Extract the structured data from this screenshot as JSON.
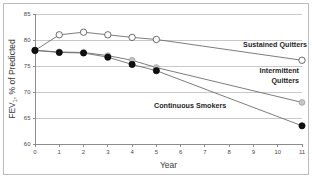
{
  "figure": {
    "background_color": "#ffffff",
    "border_color": "#bdbdbd",
    "width": 312,
    "height": 181
  },
  "chart_data": {
    "type": "line",
    "title": "",
    "xlabel": "Year",
    "ylabel": "FEV1, % of Predicted",
    "ylabel_main": "FEV",
    "ylabel_subscript": "1",
    "ylabel_rest": ", % of Predicted",
    "xlim": [
      0,
      11
    ],
    "ylim": [
      60,
      85
    ],
    "grid": true,
    "grid_axis": "y",
    "legend_position": "inline-annotations",
    "xticks": [
      0,
      1,
      2,
      3,
      4,
      5,
      6,
      7,
      8,
      9,
      10,
      11
    ],
    "xtick_labels": [
      "0",
      "1",
      "2",
      "3",
      "4",
      "5",
      "6",
      "7",
      "8",
      "9",
      "10",
      "11"
    ],
    "yticks": [
      60,
      65,
      70,
      75,
      80,
      85
    ],
    "ytick_labels": [
      "60",
      "65",
      "70",
      "75",
      "80",
      "85"
    ],
    "series": [
      {
        "name": "Sustained Quitters",
        "marker": "open-circle",
        "marker_fill": "#ffffff",
        "marker_stroke": "#5a5a5a",
        "line_color": "#6e6e6e",
        "x": [
          0,
          1,
          2,
          3,
          4,
          5,
          11
        ],
        "values": [
          78.0,
          81.0,
          81.5,
          81.0,
          80.5,
          80.1,
          76.1
        ]
      },
      {
        "name": "Intermittent Quitters",
        "marker": "gray-circle",
        "marker_fill": "#c4c4c4",
        "marker_stroke": "#9a9a9a",
        "line_color": "#6e6e6e",
        "x": [
          0,
          1,
          2,
          3,
          4,
          5,
          11
        ],
        "values": [
          78.0,
          77.7,
          77.6,
          77.0,
          76.1,
          74.7,
          68.0
        ]
      },
      {
        "name": "Continuous Smokers",
        "marker": "filled-circle",
        "marker_fill": "#111111",
        "marker_stroke": "#000000",
        "line_color": "#6e6e6e",
        "x": [
          0,
          1,
          2,
          3,
          4,
          5,
          11
        ],
        "values": [
          78.0,
          77.6,
          77.5,
          76.7,
          75.3,
          74.1,
          63.5
        ]
      }
    ],
    "annotations": [
      {
        "label": "Sustained Quitters",
        "label_lines": [
          "Sustained Quitters"
        ],
        "x_px": 307,
        "y_px": 47,
        "anchor": "end"
      },
      {
        "label": "Intermittent Quitters",
        "label_lines": [
          "Intermittent",
          "Quitters"
        ],
        "x_px": 299,
        "y_px": 73,
        "anchor": "end"
      },
      {
        "label": "Continuous Smokers",
        "label_lines": [
          "Continuous Smokers"
        ],
        "x_px": 154,
        "y_px": 108,
        "anchor": "start"
      }
    ]
  }
}
